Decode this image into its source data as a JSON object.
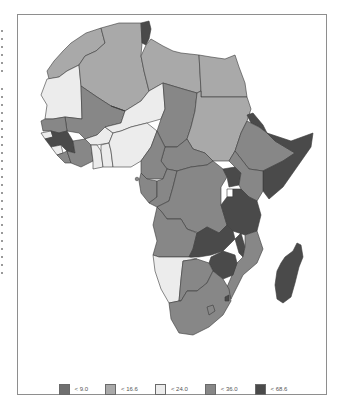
{
  "map": {
    "region": "Africa",
    "type": "choropleth",
    "colors": {
      "c1": "#6f6f6f",
      "c2": "#a9a9a9",
      "c3": "#ececec",
      "c4": "#878787",
      "c5": "#4a4a4a",
      "border": "#3a3a3a",
      "frame": "#8e8e8e"
    }
  },
  "legend": {
    "items": [
      {
        "label": "< 9.0",
        "color": "#6f6f6f"
      },
      {
        "label": "< 16.6",
        "color": "#a9a9a9"
      },
      {
        "label": "< 24.0",
        "color": "#ececec"
      },
      {
        "label": "< 36.0",
        "color": "#878787"
      },
      {
        "label": "< 68.6",
        "color": "#4a4a4a"
      }
    ]
  }
}
